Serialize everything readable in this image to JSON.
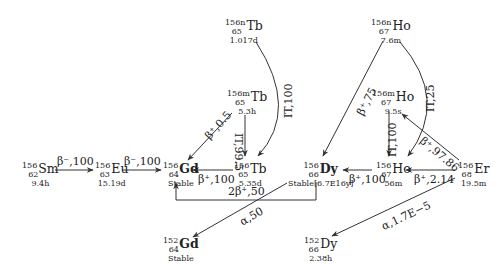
{
  "diagram": {
    "nuclides": [
      {
        "id": "Sm156",
        "mass": "156",
        "z": "62",
        "symbol": "Sm",
        "halflife": "9.4h",
        "bold": false
      },
      {
        "id": "Eu156",
        "mass": "156",
        "z": "63",
        "symbol": "Eu",
        "halflife": "15.19d",
        "bold": false
      },
      {
        "id": "Gd156",
        "mass": "156",
        "z": "64",
        "symbol": "Gd",
        "halflife": "Stable",
        "bold": true
      },
      {
        "id": "Tb156n",
        "mass": "156n",
        "z": "65",
        "symbol": "Tb",
        "halflife": "1.017d",
        "bold": false
      },
      {
        "id": "Tb156m",
        "mass": "156m",
        "z": "65",
        "symbol": "Tb",
        "halflife": "5.3h",
        "bold": false
      },
      {
        "id": "Tb156",
        "mass": "156",
        "z": "65",
        "symbol": "Tb",
        "halflife": "5.35d",
        "bold": false
      },
      {
        "id": "Dy156",
        "mass": "156",
        "z": "66",
        "symbol": "Dy",
        "halflife": "Stable[6.7E16y]",
        "bold": true
      },
      {
        "id": "Ho156n",
        "mass": "156n",
        "z": "67",
        "symbol": "Ho",
        "halflife": "7.6m",
        "bold": false
      },
      {
        "id": "Ho156m",
        "mass": "156m",
        "z": "67",
        "symbol": "Ho",
        "halflife": "9.5s",
        "bold": false
      },
      {
        "id": "Ho156",
        "mass": "156",
        "z": "67",
        "symbol": "Ho",
        "halflife": "56m",
        "bold": false
      },
      {
        "id": "Er156",
        "mass": "156",
        "z": "68",
        "symbol": "Er",
        "halflife": "19.5m",
        "bold": false
      },
      {
        "id": "Gd152",
        "mass": "152",
        "z": "64",
        "symbol": "Gd",
        "halflife": "Stable",
        "bold": true
      },
      {
        "id": "Dy152",
        "mass": "152",
        "z": "66",
        "symbol": "Dy",
        "halflife": "2.38h",
        "bold": false
      }
    ],
    "transitions": [
      {
        "from": "Sm156",
        "to": "Eu156",
        "label": "β⁻,100"
      },
      {
        "from": "Eu156",
        "to": "Gd156",
        "label": "β⁻,100"
      },
      {
        "from": "Tb156",
        "to": "Gd156",
        "label": "β⁺,100"
      },
      {
        "from": "Tb156m",
        "to": "Gd156",
        "label": "β⁺,0.5"
      },
      {
        "from": "Tb156m",
        "to": "Tb156",
        "label": "IT,99.5"
      },
      {
        "from": "Tb156n",
        "to": "Tb156",
        "label": "IT,100"
      },
      {
        "from": "Dy156",
        "to": "Gd156",
        "label": "2β⁺,50"
      },
      {
        "from": "Dy156",
        "to": "Gd152",
        "label": "α,50"
      },
      {
        "from": "Ho156n",
        "to": "Dy156",
        "label": "β⁺,75"
      },
      {
        "from": "Ho156n",
        "to": "Ho156",
        "label": "IT,25"
      },
      {
        "from": "Ho156m",
        "to": "Ho156",
        "label": "IT,100"
      },
      {
        "from": "Ho156",
        "to": "Dy156",
        "label": "β⁺,100"
      },
      {
        "from": "Er156",
        "to": "Ho156",
        "label": "β⁺,2.14"
      },
      {
        "from": "Er156",
        "to": "Ho156m",
        "label": "β⁺,97.86"
      },
      {
        "from": "Er156",
        "to": "Dy152",
        "label": "α,1.7E−5"
      }
    ]
  },
  "colors": {
    "line": "#333333",
    "text": "#222222",
    "background": "#ffffff"
  }
}
